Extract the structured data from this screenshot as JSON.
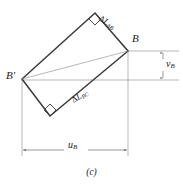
{
  "figure": {
    "caption": "(c)",
    "line_color": "#3a3a3a",
    "thin_line_color": "#8a8a8a",
    "text_color": "#1a1a1a",
    "background": "#ffffff"
  },
  "labels": {
    "b_prime": "B'",
    "b": "B",
    "delta_l_ab_symbol": "Δ",
    "delta_l_ab_main": "L",
    "delta_l_ab_sub": "AB",
    "delta_l_bc_symbol": "Δ",
    "delta_l_bc_main": "L",
    "delta_l_bc_sub": "BC",
    "v_b_main": "v",
    "v_b_sub": "B",
    "u_b_main": "u",
    "u_b_sub": "B"
  },
  "geometry": {
    "rectangle_vertices": [
      {
        "name": "B-prime-corner",
        "x": 22,
        "y": 79
      },
      {
        "name": "top-corner",
        "x": 95,
        "y": 13
      },
      {
        "name": "B-corner",
        "x": 128,
        "y": 51
      },
      {
        "name": "bottom-corner",
        "x": 50,
        "y": 116
      }
    ],
    "reference_line_y": 80,
    "v_b_dimension": {
      "x": 163,
      "y_top": 51,
      "y_bottom": 80
    },
    "u_b_dimension": {
      "y": 150,
      "x_left": 22,
      "x_right": 128
    }
  },
  "icons": {
    "right_angle_top": "right-angle-marker-icon",
    "right_angle_bottom": "right-angle-marker-icon",
    "v_arrow": "vertical-double-arrow-icon",
    "u_arrow": "horizontal-double-arrow-icon"
  }
}
